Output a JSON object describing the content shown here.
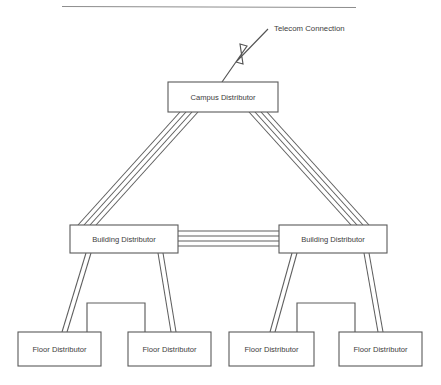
{
  "diagram": {
    "title_rule": "horizontal-rule",
    "background_color": "#ffffff",
    "line_color": "#5e5e5e",
    "text_color": "#3d3d3d",
    "nodes": {
      "campus": {
        "label": "Campus Distributor"
      },
      "building_left": {
        "label": "Building Distributor"
      },
      "building_right": {
        "label": "Building Distributor"
      },
      "floor_1": {
        "label": "Floor Distributor"
      },
      "floor_2": {
        "label": "Floor Distributor"
      },
      "floor_3": {
        "label": "Floor Distributor"
      },
      "floor_4": {
        "label": "Floor Distributor"
      }
    },
    "annotations": {
      "telecom": {
        "label": "Telecom Connection"
      }
    }
  }
}
